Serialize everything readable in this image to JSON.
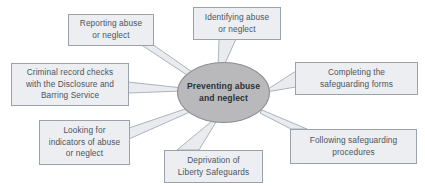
{
  "diagram": {
    "type": "radial-spider-diagram",
    "title_node": {
      "label": "Preventing abuse\nand neglect",
      "shape": "ellipse",
      "fill_color": "#b9b9bb",
      "border_color": "#8e8e92",
      "text_color": "#2b3138"
    },
    "style": {
      "box_fill": "#eceef2",
      "box_border": "#9aa3ad",
      "box_text": "#4a5560",
      "connector_fill": "#e9ebef",
      "connector_stroke": "#8d97a2",
      "background": "#ffffff"
    },
    "nodes": [
      {
        "id": "reporting-abuse",
        "label": "Reporting abuse\nor neglect",
        "position": "top-left"
      },
      {
        "id": "identifying-abuse",
        "label": "Identifying abuse\nor neglect",
        "position": "top-center"
      },
      {
        "id": "criminal-record-checks",
        "label": "Criminal record checks\nwith the Disclosure and\nBarring Service",
        "position": "left"
      },
      {
        "id": "completing-safeguarding-forms",
        "label": "Completing the\nsafeguarding forms",
        "position": "right"
      },
      {
        "id": "looking-for-indicators",
        "label": "Looking for\nindicators of abuse\nor neglect",
        "position": "bottom-left"
      },
      {
        "id": "deprivation-liberty-safeguards",
        "label": "Deprivation of\nLiberty Safeguards",
        "position": "bottom-center"
      },
      {
        "id": "following-safeguarding-procedures",
        "label": "Following safeguarding\nprocedures",
        "position": "bottom-right"
      }
    ]
  }
}
